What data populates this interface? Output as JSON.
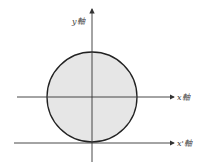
{
  "diagram": {
    "labels": {
      "y_axis": "y軸",
      "x_axis": "x軸",
      "x_prime_axis": "x'軸"
    },
    "circle": {
      "cx": 92,
      "cy": 97,
      "r": 45,
      "fill": "#e6e6e6",
      "stroke": "#222222"
    },
    "colors": {
      "axis": "#333333"
    }
  }
}
